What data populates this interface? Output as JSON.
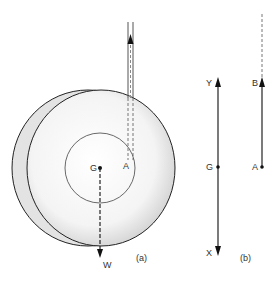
{
  "figure": {
    "part_a": {
      "caption": "(a)",
      "labels": {
        "centre": "G",
        "contact": "A",
        "weight": "W"
      }
    },
    "part_b": {
      "caption": "(b)",
      "labels": {
        "top_left": "Y",
        "mid_left": "G",
        "bottom_left": "X",
        "top_right": "B",
        "bottom_right": "A"
      }
    }
  }
}
